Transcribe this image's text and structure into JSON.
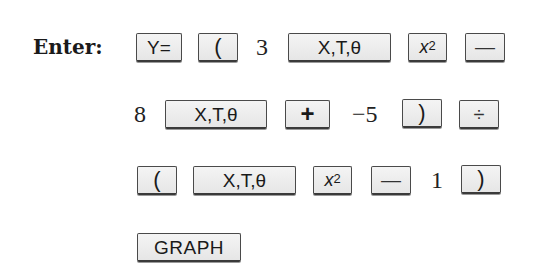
{
  "instruction": {
    "label": "Enter:"
  },
  "rows": [
    {
      "tokens": [
        {
          "type": "key",
          "text": "Y="
        },
        {
          "type": "key",
          "text": "("
        },
        {
          "type": "number",
          "text": "3"
        },
        {
          "type": "key",
          "text": "X,T,θ"
        },
        {
          "type": "key",
          "text": "x",
          "sup": "2"
        },
        {
          "type": "key",
          "text": "—"
        }
      ]
    },
    {
      "tokens": [
        {
          "type": "number",
          "text": "8"
        },
        {
          "type": "key",
          "text": "X,T,θ"
        },
        {
          "type": "key",
          "text": "+"
        },
        {
          "type": "number",
          "text": "−5"
        },
        {
          "type": "key",
          "text": ")"
        },
        {
          "type": "key",
          "text": "÷"
        }
      ]
    },
    {
      "tokens": [
        {
          "type": "key",
          "text": "("
        },
        {
          "type": "key",
          "text": "X,T,θ"
        },
        {
          "type": "key",
          "text": "x",
          "sup": "2"
        },
        {
          "type": "key",
          "text": "—"
        },
        {
          "type": "number",
          "text": "1"
        },
        {
          "type": "key",
          "text": ")"
        }
      ]
    },
    {
      "tokens": [
        {
          "type": "key",
          "text": "GRAPH"
        }
      ]
    }
  ],
  "colors": {
    "key_face": "#ececec",
    "key_border": "#4a4a4a",
    "text": "#1a1a1a"
  }
}
